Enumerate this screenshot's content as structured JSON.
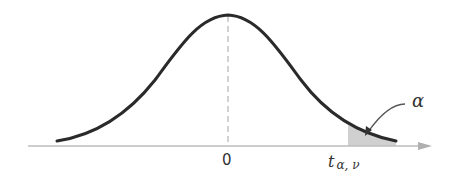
{
  "figure": {
    "center_label": "0",
    "critical_label_main": "t",
    "critical_label_sub": "α, ν",
    "tail_label": "α",
    "colors": {
      "curve": "#2a2a2a",
      "axis": "#b8b8b8",
      "shade": "#cfcfcf",
      "dashed": "#b0b0b0"
    }
  }
}
